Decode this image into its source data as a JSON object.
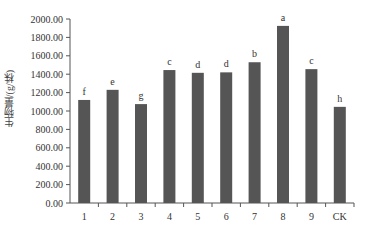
{
  "chart_data": {
    "type": "bar",
    "title": "",
    "xlabel": "",
    "ylabel": "生物量/(g/株)",
    "ylim": [
      0,
      2000
    ],
    "yticks": [
      "0.00",
      "200.00",
      "400.00",
      "600.00",
      "800.00",
      "1000.00",
      "1200.00",
      "1400.00",
      "1600.00",
      "1800.00",
      "2000.00"
    ],
    "grid": false,
    "legend": null,
    "categories": [
      "1",
      "2",
      "3",
      "4",
      "5",
      "6",
      "7",
      "8",
      "9",
      "CK"
    ],
    "values": [
      1120,
      1230,
      1075,
      1445,
      1415,
      1420,
      1530,
      1925,
      1455,
      1045
    ],
    "annotations": [
      "f",
      "e",
      "g",
      "c",
      "d",
      "d",
      "b",
      "a",
      "c",
      "h"
    ],
    "bar_color": "#555555"
  }
}
